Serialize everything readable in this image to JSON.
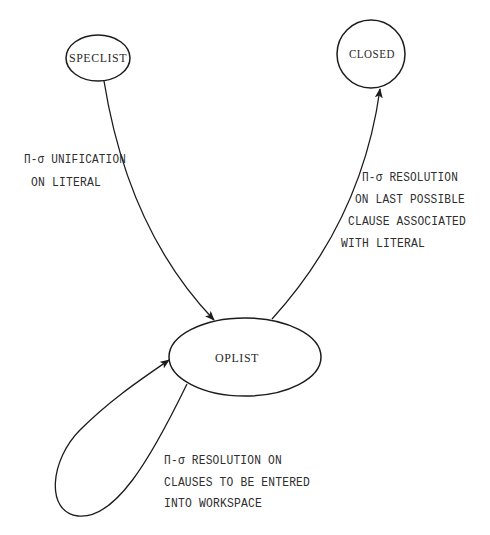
{
  "diagram": {
    "type": "state-transition-diagram",
    "nodes": [
      {
        "id": "speclist",
        "label": "SPECLIST",
        "shape": "ellipse"
      },
      {
        "id": "closed",
        "label": "CLOSED",
        "shape": "circle"
      },
      {
        "id": "oplist",
        "label": "OPLIST",
        "shape": "ellipse"
      }
    ],
    "edges": [
      {
        "from": "SPECLIST",
        "to": "OPLIST",
        "label_lines": [
          "Π-σ UNIFICATION",
          "ON LITERAL"
        ]
      },
      {
        "from": "OPLIST",
        "to": "CLOSED",
        "label_lines": [
          "Π-σ RESOLUTION",
          "ON LAST POSSIBLE",
          "CLAUSE ASSOCIATED",
          "WITH LITERAL"
        ]
      },
      {
        "from": "OPLIST",
        "to": "OPLIST",
        "label_lines": [
          "Π-σ RESOLUTION ON",
          "CLAUSES TO BE ENTERED",
          "INTO WORKSPACE"
        ]
      }
    ],
    "colors": {
      "stroke": "#1c1c1c",
      "text": "#2a2a2a",
      "background": "#ffffff"
    }
  }
}
